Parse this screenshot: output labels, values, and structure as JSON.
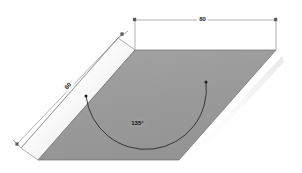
{
  "figure": {
    "background_color": "#ffffff"
  },
  "shape": {
    "name": "parallelogram",
    "fill_color": "#9a9a9a",
    "edge_color": "#6e6e6e",
    "band_color": "#f7f7f7",
    "band_shadow_color": "#b9b9b9"
  },
  "dimensions": {
    "top": {
      "label": "80",
      "line_color": "#777777"
    },
    "side": {
      "label": "60",
      "line_color": "#777777"
    }
  },
  "angle": {
    "label": "135°",
    "arc_color": "#2b2b2b"
  }
}
